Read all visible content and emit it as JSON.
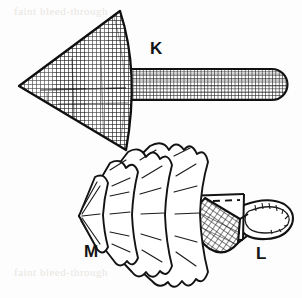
{
  "figure": {
    "type": "technical-line-drawing",
    "background_color": "#fdfdfd",
    "ink_color": "#141414",
    "width": 302,
    "height": 298,
    "labels": [
      {
        "id": "K",
        "text": "K",
        "x": 150,
        "y": 40,
        "refers_to": "crosshatched wedge fan with rounded stem"
      },
      {
        "id": "M",
        "text": "M",
        "x": 84,
        "y": 243,
        "refers_to": "pleated ruffled fan"
      },
      {
        "id": "L",
        "text": "L",
        "x": 256,
        "y": 245,
        "refers_to": "strap with crosshatched tab and loop buckle"
      }
    ],
    "ghost_text": {
      "top": "faint bleed-through",
      "bottom": "faint bleed-through"
    },
    "parts": {
      "k": {
        "name": "crosshatched-wedge",
        "apex": [
          19,
          86
        ],
        "top_vertex": [
          120,
          11
        ],
        "bottom_vertex": [
          126,
          150
        ],
        "fill": "crosshatch-grid",
        "stem": {
          "name": "rounded-stem",
          "x": 131,
          "y": 69,
          "width": 157,
          "height": 31,
          "round_end": "right",
          "fill": "crosshatch-grid"
        }
      },
      "m": {
        "name": "pleated-fan",
        "apex": [
          78,
          216
        ],
        "pleat_layers": 4,
        "scallops_per_layer": 7,
        "fill": "white-with-radial-fold-lines"
      },
      "l": {
        "name": "strap-with-buckle",
        "strap": {
          "x": 186,
          "y": 194,
          "width": 62,
          "height": 46,
          "stitching": "dashed"
        },
        "tab": {
          "cx": 222,
          "cy": 228,
          "fill": "crosshatch-diagonal"
        },
        "loop": {
          "cx": 264,
          "cy": 218,
          "rx": 28,
          "ry": 16,
          "ticks": 9
        }
      }
    }
  }
}
